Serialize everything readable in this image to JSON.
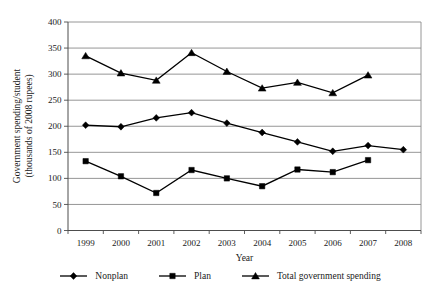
{
  "chart_data": {
    "type": "line",
    "title": "",
    "xlabel": "Year",
    "ylabel": "Government spending/student (thousands of 2008 rupees)",
    "ylabel_lines": [
      "Government spending/student",
      "(thousands of 2008 rupees)"
    ],
    "categories": [
      "1999",
      "2000",
      "2001",
      "2002",
      "2003",
      "2004",
      "2005",
      "2006",
      "2007",
      "2008"
    ],
    "ylim": [
      0,
      400
    ],
    "yticks": [
      0,
      50,
      100,
      150,
      200,
      250,
      300,
      350,
      400
    ],
    "grid": true,
    "legend_position": "bottom",
    "series": [
      {
        "name": "Nonplan",
        "marker": "diamond",
        "color": "#000000",
        "values": [
          202,
          199,
          216,
          226,
          206,
          188,
          170,
          152,
          163,
          155
        ]
      },
      {
        "name": "Plan",
        "marker": "square",
        "color": "#000000",
        "values": [
          133,
          104,
          72,
          116,
          100,
          85,
          117,
          112,
          135,
          null
        ]
      },
      {
        "name": "Total government spending",
        "marker": "triangle",
        "color": "#000000",
        "values": [
          335,
          302,
          288,
          341,
          305,
          273,
          284,
          264,
          298,
          null
        ]
      }
    ]
  },
  "colors": {
    "background": "#ffffff",
    "grid": "#8a8a8a",
    "axis": "#4d4d4d",
    "line": "#000000",
    "text": "#1a1a1a"
  }
}
